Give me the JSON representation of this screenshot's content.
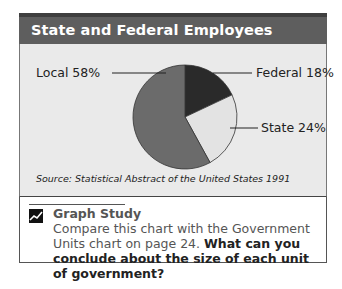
{
  "header": {
    "title": "State and Federal Employees"
  },
  "chart_data": {
    "type": "pie",
    "title": "State and Federal Employees",
    "slices": [
      {
        "label": "Federal",
        "value": 18,
        "display": "Federal 18%",
        "color": "#2a2a2a"
      },
      {
        "label": "State",
        "value": 24,
        "display": "State 24%",
        "color": "#e3e3e3"
      },
      {
        "label": "Local",
        "value": 58,
        "display": "Local 58%",
        "color": "#6b6b6b"
      }
    ],
    "start_angle": "12 o'clock, clockwise",
    "legend": "leader-line labels"
  },
  "labels": {
    "local": "Local 58%",
    "federal": "Federal 18%",
    "state": "State 24%"
  },
  "source": "Source:  Statistical Abstract of the United States 1991",
  "study": {
    "icon": "chart-trend-icon",
    "title": "Graph Study",
    "text_plain": "Compare this chart with the Government Units chart on page 24.",
    "text_bold": "What can you conclude about the size of each unit of government?"
  }
}
